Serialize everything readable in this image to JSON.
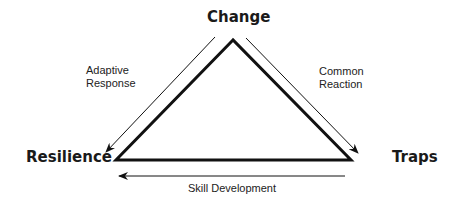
{
  "nodes": {
    "top": {
      "label": "Change"
    },
    "left": {
      "label": "Resilience"
    },
    "right": {
      "label": "Traps"
    }
  },
  "edges": {
    "left": {
      "line1": "Adaptive",
      "line2": "Response",
      "direction": "Change → Resilience"
    },
    "right": {
      "line1": "Common",
      "line2": "Reaction",
      "direction": "Change → Traps"
    },
    "bottom": {
      "label": "Skill Development",
      "direction": "Traps → Resilience"
    }
  },
  "colors": {
    "stroke": "#111111",
    "background": "#ffffff"
  }
}
